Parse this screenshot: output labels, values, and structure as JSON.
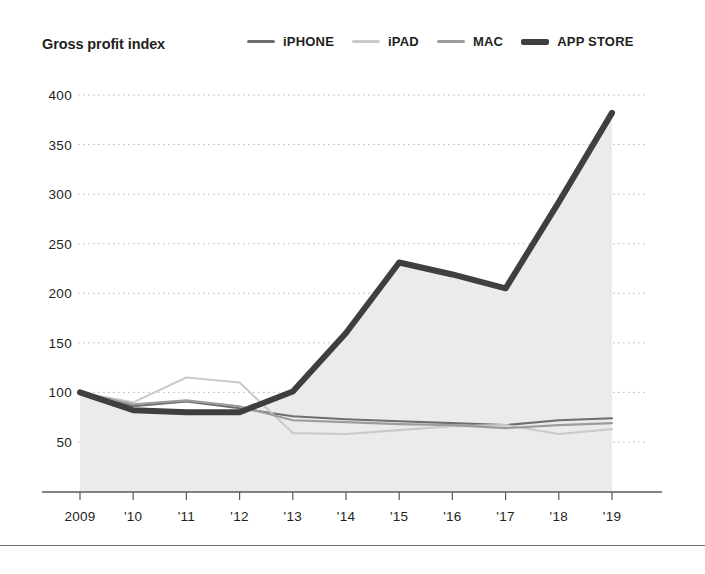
{
  "header": {
    "title": "Gross profit index"
  },
  "legend": {
    "position": "top-right",
    "items": [
      {
        "label": "iPHONE",
        "color": "#6d6e70",
        "width": 2.2
      },
      {
        "label": "iPAD",
        "color": "#c9cacc",
        "width": 2.2
      },
      {
        "label": "MAC",
        "color": "#9b9c9e",
        "width": 2.2
      },
      {
        "label": "APP STORE",
        "color": "#3f3f41",
        "width": 6
      }
    ]
  },
  "axes": {
    "y_ticks": [
      "400",
      "350",
      "300",
      "250",
      "200",
      "150",
      "100",
      "50"
    ],
    "x_ticks": [
      "2009",
      "'10",
      "'11",
      "'12",
      "'13",
      "'14",
      "'15",
      "'16",
      "'17",
      "'18",
      "'19"
    ],
    "ylim": [
      0,
      420
    ],
    "grid": "dotted-horizontal",
    "grid_color": "#b9babc",
    "axis_color": "#58595b"
  },
  "chart_data": {
    "type": "line",
    "title": "Gross profit index",
    "xlabel": "",
    "ylabel": "Gross profit index",
    "ylim": [
      0,
      420
    ],
    "categories": [
      "2009",
      "'10",
      "'11",
      "'12",
      "'13",
      "'14",
      "'15",
      "'16",
      "'17",
      "'18",
      "'19"
    ],
    "grid": true,
    "legend_position": "top-right",
    "series": [
      {
        "name": "iPHONE",
        "color": "#6d6e70",
        "values": [
          100,
          86,
          91,
          84,
          76,
          73,
          71,
          69,
          67,
          72,
          74
        ]
      },
      {
        "name": "iPAD",
        "color": "#c9cacc",
        "values": [
          100,
          90,
          115,
          110,
          59,
          58,
          62,
          66,
          67,
          58,
          63
        ]
      },
      {
        "name": "MAC",
        "color": "#9b9c9e",
        "values": [
          100,
          88,
          92,
          86,
          72,
          70,
          68,
          67,
          64,
          67,
          69
        ]
      },
      {
        "name": "APP STORE",
        "color": "#3f3f41",
        "values": [
          100,
          82,
          80,
          80,
          101,
          160,
          231,
          219,
          205,
          292,
          382
        ],
        "filled": true,
        "fill_color": "#ebebec"
      }
    ]
  },
  "footer": {
    "rule": "horizontal-rule"
  }
}
